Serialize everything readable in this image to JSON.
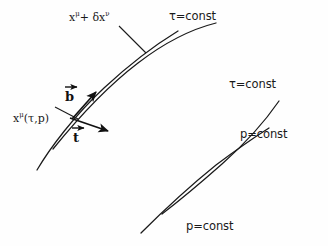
{
  "figure": {
    "background_color": "#fefefe",
    "stroke_color": "#1a1a1a",
    "labels": {
      "point_shifted": "xμ+ δxν",
      "point_shifted_base": "x",
      "point_shifted_sup1": "μ",
      "point_shifted_mid": "+ δx",
      "point_shifted_sup2": "ν",
      "point_origin_base": "x",
      "point_origin_sup": "μ",
      "point_origin_args": "(τ,p)",
      "tau_const_top": "τ=const",
      "tau_const_right": "τ=const",
      "p_const_right": "p=const",
      "p_const_bottom": "p=const",
      "vector_b": "b",
      "vector_t": "t"
    },
    "curves": {
      "tau_const_upper": "arc from upper-left through top intersection to right",
      "tau_const_lower": "arc from left through bottom intersection to right",
      "p_const_left": "arc from lower-left through left intersection to upper-right",
      "p_const_right": "arc from upper-right through right intersection to lower-left"
    },
    "vectors": [
      {
        "name": "b",
        "origin": [
          73,
          117
        ],
        "tip": [
          97,
          91
        ],
        "description": "normal vector pointing up-right along p=const curve"
      },
      {
        "name": "t",
        "origin": [
          73,
          117
        ],
        "tip": [
          110,
          131
        ],
        "description": "tangent vector pointing down-right along tau=const curve"
      }
    ],
    "intersections": [
      {
        "name": "top",
        "x": 138,
        "y": 42
      },
      {
        "name": "left",
        "x": 73,
        "y": 117
      },
      {
        "name": "right",
        "x": 231,
        "y": 122
      },
      {
        "name": "bottom",
        "x": 170,
        "y": 195
      }
    ]
  }
}
